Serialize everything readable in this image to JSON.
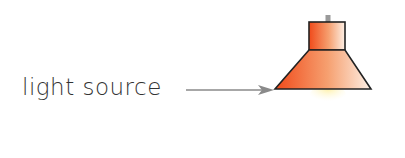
{
  "diagram": {
    "label": "light source",
    "colors": {
      "shade_dark": "#f04a1a",
      "shade_light": "#fbe6d6",
      "outline": "#222222",
      "arrow": "#888888",
      "stem": "#9a9a9a",
      "glow": "#fff3b0"
    }
  }
}
